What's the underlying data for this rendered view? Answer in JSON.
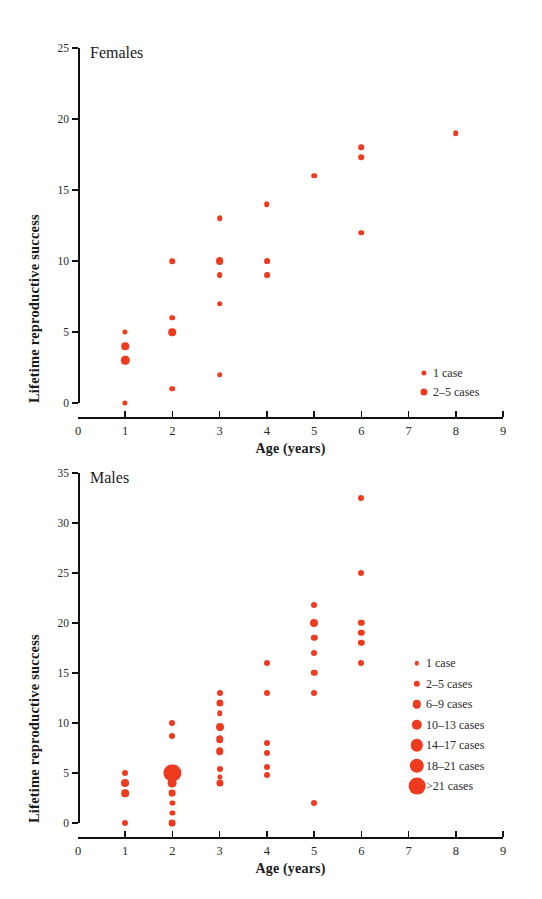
{
  "figure": {
    "marker_color": "#ee3b20",
    "axis_color": "#111111"
  },
  "chart_data": [
    {
      "type": "scatter",
      "title": "Females",
      "xlabel": "Age (years)",
      "ylabel": "Lifetime reproductive success",
      "xlim": [
        0,
        9
      ],
      "ylim": [
        0,
        25
      ],
      "xticks": [
        "0",
        "1",
        "2",
        "3",
        "4",
        "5",
        "6",
        "7",
        "8",
        "9"
      ],
      "yticks": [
        "0",
        "5",
        "10",
        "15",
        "20",
        "25"
      ],
      "grid": false,
      "legend_position": "lower-right",
      "size_encoding": "marker area encodes number of cases",
      "legend": [
        {
          "label": "1 case",
          "radius_px": 2.6
        },
        {
          "label": "2–5 cases",
          "radius_px": 3.6
        }
      ],
      "points": [
        {
          "x": 1,
          "y": 5,
          "cases": "1 case",
          "r": 2.6
        },
        {
          "x": 1,
          "y": 4,
          "cases": "2–5 cases",
          "r": 3.8
        },
        {
          "x": 1,
          "y": 3,
          "cases": "2–5 cases",
          "r": 4.2
        },
        {
          "x": 1,
          "y": 0,
          "cases": "1 case",
          "r": 2.6
        },
        {
          "x": 2,
          "y": 10,
          "cases": "1 case",
          "r": 2.8
        },
        {
          "x": 2,
          "y": 6,
          "cases": "1 case",
          "r": 2.8
        },
        {
          "x": 2,
          "y": 5,
          "cases": "2–5 cases",
          "r": 3.8
        },
        {
          "x": 2,
          "y": 1,
          "cases": "1 case",
          "r": 2.8
        },
        {
          "x": 3,
          "y": 13,
          "cases": "1 case",
          "r": 2.8
        },
        {
          "x": 3,
          "y": 10,
          "cases": "2–5 cases",
          "r": 3.9
        },
        {
          "x": 3,
          "y": 9,
          "cases": "1 case",
          "r": 2.9
        },
        {
          "x": 3,
          "y": 7,
          "cases": "1 case",
          "r": 2.8
        },
        {
          "x": 3,
          "y": 2,
          "cases": "1 case",
          "r": 2.8
        },
        {
          "x": 4,
          "y": 14,
          "cases": "1 case",
          "r": 2.8
        },
        {
          "x": 4,
          "y": 10,
          "cases": "1 case",
          "r": 2.9
        },
        {
          "x": 4,
          "y": 9,
          "cases": "1 case",
          "r": 2.9
        },
        {
          "x": 5,
          "y": 16,
          "cases": "1 case",
          "r": 2.8
        },
        {
          "x": 6,
          "y": 18,
          "cases": "1 case",
          "r": 2.8
        },
        {
          "x": 6,
          "y": 17.3,
          "cases": "1 case",
          "r": 2.8
        },
        {
          "x": 6,
          "y": 12,
          "cases": "1 case",
          "r": 2.8
        },
        {
          "x": 8,
          "y": 19,
          "cases": "1 case",
          "r": 2.8
        }
      ]
    },
    {
      "type": "scatter",
      "title": "Males",
      "xlabel": "Age (years)",
      "ylabel": "Lifetime reproductive success",
      "xlim": [
        0,
        9
      ],
      "ylim": [
        0,
        35
      ],
      "xticks": [
        "0",
        "1",
        "2",
        "3",
        "4",
        "5",
        "6",
        "7",
        "8",
        "9"
      ],
      "yticks": [
        "0",
        "5",
        "10",
        "15",
        "20",
        "25",
        "30",
        "35"
      ],
      "grid": false,
      "legend_position": "middle-right",
      "size_encoding": "marker area encodes number of cases",
      "legend": [
        {
          "label": "1 case",
          "radius_px": 2.2
        },
        {
          "label": "2–5 cases",
          "radius_px": 3.2
        },
        {
          "label": "6–9 cases",
          "radius_px": 4.2
        },
        {
          "label": "10–13 cases",
          "radius_px": 5.2
        },
        {
          "label": "14–17 cases",
          "radius_px": 6.2
        },
        {
          "label": "18–21 cases",
          "radius_px": 7.2
        },
        {
          "label": ">21 cases",
          "radius_px": 8.4
        }
      ],
      "points": [
        {
          "x": 1,
          "y": 5,
          "cases": "1 case",
          "r": 3.0
        },
        {
          "x": 1,
          "y": 4,
          "cases": "2–5 cases",
          "r": 4.0
        },
        {
          "x": 1,
          "y": 3,
          "cases": "2–5 cases",
          "r": 3.8
        },
        {
          "x": 1,
          "y": 0,
          "cases": "1 case",
          "r": 3.0
        },
        {
          "x": 2,
          "y": 10,
          "cases": "1 case",
          "r": 3.0
        },
        {
          "x": 2,
          "y": 8.7,
          "cases": "1 case",
          "r": 3.0
        },
        {
          "x": 2,
          "y": 5,
          "cases": ">21 cases",
          "r": 8.6
        },
        {
          "x": 2,
          "y": 4,
          "cases": "6–9 cases",
          "r": 4.4
        },
        {
          "x": 2,
          "y": 3,
          "cases": "2–5 cases",
          "r": 3.4
        },
        {
          "x": 2,
          "y": 2,
          "cases": "1 case",
          "r": 2.6
        },
        {
          "x": 2,
          "y": 1,
          "cases": "1 case",
          "r": 2.6
        },
        {
          "x": 2,
          "y": 0,
          "cases": "2–5 cases",
          "r": 3.4
        },
        {
          "x": 3,
          "y": 13,
          "cases": "1 case",
          "r": 3.0
        },
        {
          "x": 3,
          "y": 12,
          "cases": "2–5 cases",
          "r": 3.6
        },
        {
          "x": 3,
          "y": 11,
          "cases": "1 case",
          "r": 2.8
        },
        {
          "x": 3,
          "y": 9.6,
          "cases": "2–5 cases",
          "r": 4.0
        },
        {
          "x": 3,
          "y": 8.4,
          "cases": "2–5 cases",
          "r": 3.8
        },
        {
          "x": 3,
          "y": 7.2,
          "cases": "2–5 cases",
          "r": 3.8
        },
        {
          "x": 3,
          "y": 5.4,
          "cases": "1 case",
          "r": 3.0
        },
        {
          "x": 3,
          "y": 4.6,
          "cases": "1 case",
          "r": 2.6
        },
        {
          "x": 3,
          "y": 4,
          "cases": "2–5 cases",
          "r": 3.6
        },
        {
          "x": 4,
          "y": 16,
          "cases": "1 case",
          "r": 3.0
        },
        {
          "x": 4,
          "y": 13,
          "cases": "1 case",
          "r": 3.0
        },
        {
          "x": 4,
          "y": 8,
          "cases": "1 case",
          "r": 3.0
        },
        {
          "x": 4,
          "y": 7,
          "cases": "1 case",
          "r": 3.0
        },
        {
          "x": 4,
          "y": 5.6,
          "cases": "1 case",
          "r": 3.0
        },
        {
          "x": 4,
          "y": 4.8,
          "cases": "1 case",
          "r": 3.0
        },
        {
          "x": 5,
          "y": 21.8,
          "cases": "1 case",
          "r": 3.0
        },
        {
          "x": 5,
          "y": 20,
          "cases": "2–5 cases",
          "r": 4.0
        },
        {
          "x": 5,
          "y": 18.5,
          "cases": "1 case",
          "r": 3.2
        },
        {
          "x": 5,
          "y": 17,
          "cases": "1 case",
          "r": 3.0
        },
        {
          "x": 5,
          "y": 15,
          "cases": "1 case",
          "r": 3.2
        },
        {
          "x": 5,
          "y": 13,
          "cases": "1 case",
          "r": 3.0
        },
        {
          "x": 5,
          "y": 2,
          "cases": "1 case",
          "r": 3.0
        },
        {
          "x": 6,
          "y": 32.5,
          "cases": "1 case",
          "r": 3.0
        },
        {
          "x": 6,
          "y": 25,
          "cases": "1 case",
          "r": 3.0
        },
        {
          "x": 6,
          "y": 20,
          "cases": "1 case",
          "r": 3.2
        },
        {
          "x": 6,
          "y": 19,
          "cases": "1 case",
          "r": 3.2
        },
        {
          "x": 6,
          "y": 18,
          "cases": "1 case",
          "r": 3.2
        },
        {
          "x": 6,
          "y": 16,
          "cases": "1 case",
          "r": 3.0
        }
      ]
    }
  ]
}
